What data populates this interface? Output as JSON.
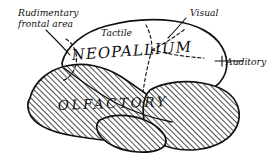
{
  "figure": {
    "background_color": "#ffffff",
    "ink_color": "#111111"
  },
  "labels": {
    "rudimentary_line1": "Rudimentary",
    "rudimentary_line2": "frontal area",
    "tactile": "Tactile",
    "visual": "Visual",
    "auditory": "Auditory",
    "neopallium": "NEOPALLIUM",
    "olfactory": "OLFACTORY"
  },
  "regions": [
    {
      "name": "neopallium",
      "label": "NEOPALLIUM",
      "fill": "plain"
    },
    {
      "name": "olfactory",
      "label": "OLFACTORY",
      "fill": "hatched"
    }
  ],
  "callouts": [
    {
      "name": "rudimentary-frontal-area",
      "text": "Rudimentary frontal area"
    },
    {
      "name": "tactile",
      "text": "Tactile"
    },
    {
      "name": "visual",
      "text": "Visual"
    },
    {
      "name": "auditory",
      "text": "Auditory"
    }
  ]
}
